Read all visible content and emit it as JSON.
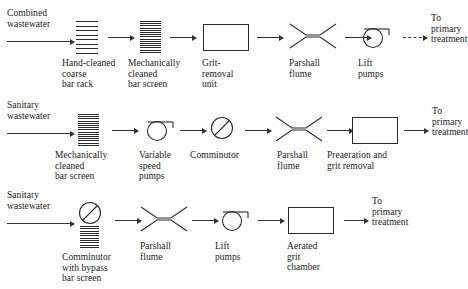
{
  "figure": {
    "type": "process-flow-diagram",
    "row_count": 3
  },
  "rows": [
    {
      "id": "row-1",
      "inlet_label": "Combined\nwastewater",
      "outlet_label": "To\nprimary\ntreatment",
      "stages": [
        {
          "name": "hand-cleaned-coarse-bar-rack",
          "symbol": "bar-rack",
          "label": "Hand-cleaned\ncoarse\nbar rack"
        },
        {
          "name": "mechanically-cleaned-bar-screen",
          "symbol": "bar-screen",
          "label": "Mechanically\ncleaned\nbar screen"
        },
        {
          "name": "grit-removal-unit",
          "symbol": "box",
          "label": "Grit-\nremoval\nunit"
        },
        {
          "name": "parshall-flume",
          "symbol": "flume",
          "label": "Parshall\nflume"
        },
        {
          "name": "lift-pumps",
          "symbol": "pump",
          "label": "Lift\npumps"
        }
      ]
    },
    {
      "id": "row-2",
      "inlet_label": "Sanitary\nwastewater",
      "outlet_label": "To\nprimary\ntreatment",
      "stages": [
        {
          "name": "mechanically-cleaned-bar-screen",
          "symbol": "bar-screen",
          "label": "Mechanically\ncleaned\nbar screen"
        },
        {
          "name": "variable-speed-pumps",
          "symbol": "pump",
          "label": "Variable\nspeed\npumps"
        },
        {
          "name": "comminutor",
          "symbol": "comminutor",
          "label": "Comminutor"
        },
        {
          "name": "parshall-flume",
          "symbol": "flume",
          "label": "Parshall\nflume"
        },
        {
          "name": "preaeration-and-grit-removal",
          "symbol": "box",
          "label": "Preaeration and\ngrit removal"
        }
      ]
    },
    {
      "id": "row-3",
      "inlet_label": "Sanitary\nwastewater",
      "outlet_label": "To\nprimary\ntreatment",
      "stages": [
        {
          "name": "comminutor-with-bypass-bar-screen",
          "symbol": "comminutor-over-screen",
          "label": "Comminutor\nwith bypass\nbar screen"
        },
        {
          "name": "parshall-flume",
          "symbol": "flume",
          "label": "Parshall\nflume"
        },
        {
          "name": "lift-pumps",
          "symbol": "pump",
          "label": "Lift\npumps"
        },
        {
          "name": "aerated-grit-chamber",
          "symbol": "box",
          "label": "Aerated\ngrit\nchamber"
        }
      ]
    }
  ],
  "style": {
    "line_color": "#2b2b2b",
    "arrow_color": "#333333",
    "text_color": "#1a1a1a",
    "background": "#ffffff"
  }
}
